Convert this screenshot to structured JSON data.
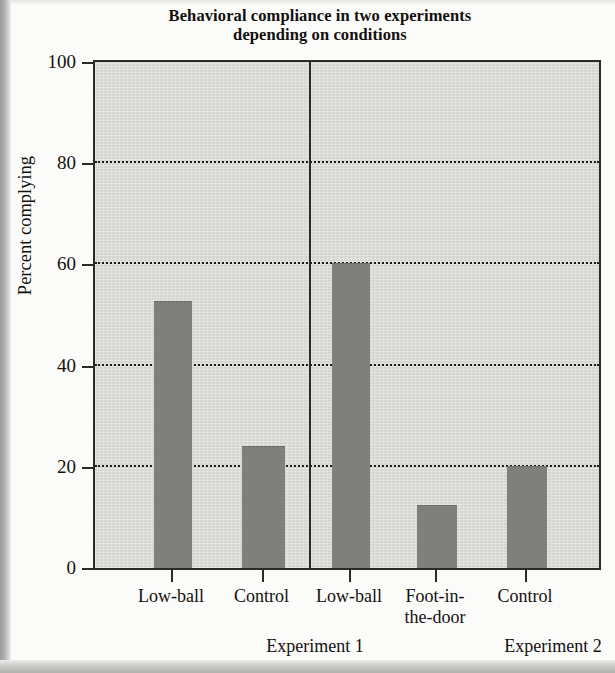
{
  "figure": {
    "title_lines": [
      "Behavioral compliance in two experiments",
      "depending on conditions"
    ],
    "y_axis_title": "Percent complying",
    "bar_color": "#7f7f7d",
    "plot_background": "#d5d5d3",
    "axis_color": "#2c2a28",
    "page_background": "#fbfbfa"
  },
  "chart_data": {
    "type": "bar",
    "title": "Behavioral compliance in two experiments depending on conditions",
    "xlabel": "",
    "ylabel": "Percent complying",
    "ylim": [
      0,
      100
    ],
    "yticks": [
      0,
      20,
      40,
      60,
      80,
      100
    ],
    "ytick_labels": [
      "0",
      "20",
      "40",
      "60",
      "80",
      "100"
    ],
    "grid": "horizontal dotted at 20, 40, 60, 80",
    "legend": "none",
    "groups": [
      {
        "name": "Experiment 1",
        "categories": [
          "Low-ball",
          "Control"
        ],
        "values": [
          52.5,
          24
        ]
      },
      {
        "name": "Experiment 2",
        "categories": [
          "Low-ball",
          "Foot-in-the-door",
          "Control"
        ],
        "values": [
          60,
          12.2,
          20
        ]
      }
    ],
    "categories": [
      "Low-ball",
      "Control",
      "Low-ball",
      "Foot-in-the-door",
      "Control"
    ],
    "values": [
      52.5,
      24,
      60,
      12.2,
      20
    ]
  },
  "bars": [
    {
      "label_lines": [
        "Low-ball"
      ],
      "value": 52.5,
      "left": 59,
      "width": 38
    },
    {
      "label_lines": [
        "Control"
      ],
      "value": 24,
      "left": 147,
      "width": 43
    },
    {
      "label_lines": [
        "Low-ball"
      ],
      "value": 60,
      "left": 237,
      "width": 38
    },
    {
      "label_lines": [
        "Foot-in-",
        "the-door"
      ],
      "value": 12.2,
      "left": 322,
      "width": 40
    },
    {
      "label_lines": [
        "Control"
      ],
      "value": 20,
      "left": 412,
      "width": 40
    }
  ],
  "groups": [
    {
      "label": "Experiment 1",
      "center": 222
    },
    {
      "label": "Experiment 2",
      "center": 460
    }
  ]
}
